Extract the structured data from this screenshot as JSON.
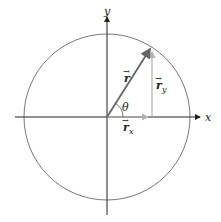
{
  "diagram": {
    "axes": {
      "x_label": "x",
      "y_label": "y"
    },
    "vectors": {
      "r": {
        "symbol": "r",
        "arrow": "→"
      },
      "r_x": {
        "symbol": "r",
        "subscript": "x",
        "arrow": "→"
      },
      "r_y": {
        "symbol": "r",
        "subscript": "y",
        "arrow": "→"
      }
    },
    "angle_label": "θ",
    "angle_degrees": 58,
    "colors": {
      "axis": "#222222",
      "circle": "#555555",
      "vector_r": "#666666",
      "components": "#b3b3b3"
    }
  }
}
